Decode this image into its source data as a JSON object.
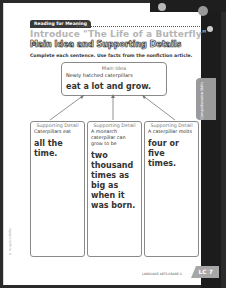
{
  "header": {
    "banner_label": "Reading for Meaning",
    "title": "Introduce \"The Life of a Butterfly\"",
    "subtitle": "Main Idea and Supporting Details",
    "instructions": "Complete each sentence. Use facts from the nonfiction article."
  },
  "main_idea": {
    "heading": "Main Idea",
    "lead": "Newly hatched caterpillars",
    "answer": "eat a lot and grow."
  },
  "supporting_details": [
    {
      "heading": "Supporting Detail",
      "lead": "Caterpillars eat",
      "answer": "all the time."
    },
    {
      "heading": "Supporting Detail",
      "lead": "A monarch caterpillar can grow to be",
      "answer": "two thousand times as big as when it was born."
    },
    {
      "heading": "Supporting Detail",
      "lead": "A caterpillar molts",
      "answer": "four or five times."
    }
  ],
  "side_tab": {
    "label": "Comprehension Skills"
  },
  "footer": {
    "text": "LANGUAGE ARTS GRADE 4",
    "page_label": "LC 7"
  },
  "copyright": "© Houghton Mifflin"
}
